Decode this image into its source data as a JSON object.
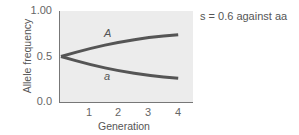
{
  "chart_data": {
    "type": "line",
    "title": "",
    "annotation": "s = 0.6 against aa",
    "xlabel": "Generation",
    "ylabel": "Allele frequency",
    "x": [
      0,
      1,
      2,
      3,
      4
    ],
    "xticks": [
      "1",
      "2",
      "3",
      "4"
    ],
    "yticks": [
      "0.0",
      "0.5",
      "1.00"
    ],
    "xlim": [
      0,
      4.5
    ],
    "ylim": [
      0,
      1.0
    ],
    "grid": false,
    "legend": "inline labels",
    "series": [
      {
        "name": "A",
        "values": [
          0.5,
          0.59,
          0.66,
          0.71,
          0.74
        ]
      },
      {
        "name": "a",
        "values": [
          0.5,
          0.41,
          0.34,
          0.29,
          0.26
        ]
      }
    ],
    "colors": {
      "line": "#555555",
      "plot_bg": "#ececec",
      "axis": "#777777"
    }
  }
}
